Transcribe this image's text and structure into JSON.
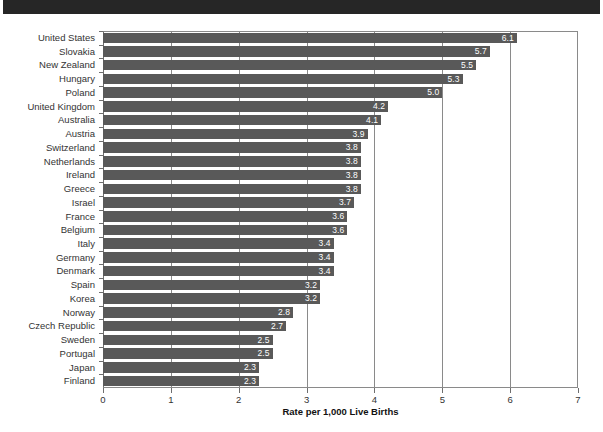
{
  "title_band": {
    "text": ""
  },
  "chart_data": {
    "type": "bar",
    "orientation": "horizontal",
    "title": "",
    "xlabel": "Rate per 1,000 Live Births",
    "ylabel": "",
    "xlim": [
      0,
      7
    ],
    "xticks": [
      "0",
      "1",
      "2",
      "3",
      "4",
      "5",
      "6",
      "7"
    ],
    "grid": "vertical",
    "legend": "none",
    "bar_color": "#595959",
    "value_label_color": "#ffffff",
    "categories": [
      "United States",
      "Slovakia",
      "New Zealand",
      "Hungary",
      "Poland",
      "United Kingdom",
      "Australia",
      "Austria",
      "Switzerland",
      "Netherlands",
      "Ireland",
      "Greece",
      "Israel",
      "France",
      "Belgium",
      "Italy",
      "Germany",
      "Denmark",
      "Spain",
      "Korea",
      "Norway",
      "Czech Republic",
      "Sweden",
      "Portugal",
      "Japan",
      "Finland"
    ],
    "values": [
      6.1,
      5.7,
      5.5,
      5.3,
      5.0,
      4.2,
      4.1,
      3.9,
      3.8,
      3.8,
      3.8,
      3.8,
      3.7,
      3.6,
      3.6,
      3.4,
      3.4,
      3.4,
      3.2,
      3.2,
      2.8,
      2.7,
      2.5,
      2.5,
      2.3,
      2.3
    ],
    "value_labels": [
      "6.1",
      "5.7",
      "5.5",
      "5.3",
      "5.0",
      "4.2",
      "4.1",
      "3.9",
      "3.8",
      "3.8",
      "3.8",
      "3.8",
      "3.7",
      "3.6",
      "3.6",
      "3.4",
      "3.4",
      "3.4",
      "3.2",
      "3.2",
      "2.8",
      "2.7",
      "2.5",
      "2.5",
      "2.3",
      "2.3"
    ]
  }
}
